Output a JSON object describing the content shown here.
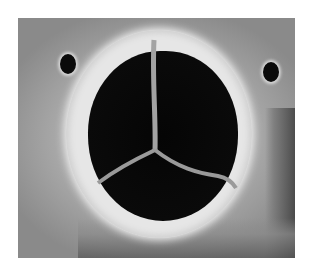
{
  "image": {
    "description": "Grayscale photograph of an aortic valve specimen viewed from above, showing three cusps meeting at a central coaptation point, surrounded by a pale annulus with two coronary ostia",
    "background_color": "#ffffff",
    "palette": {
      "orifice": "#050505",
      "annulus": "#e6e6e6",
      "surrounding_tissue": "#a8a8a8",
      "cusp_edges": "#9a9a9a"
    },
    "features": [
      "annulus-ring",
      "three-cusps",
      "commissure-center",
      "left-coronary-ostium",
      "right-coronary-ostium"
    ]
  }
}
